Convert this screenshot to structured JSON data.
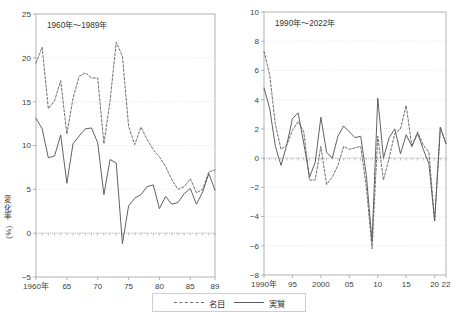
{
  "figure": {
    "top_title": "",
    "background": "#ffffff",
    "series_colors": {
      "nominal": "#6f6f6f",
      "real": "#5a5a5a"
    },
    "axis_color": "#aaaaaa",
    "grid_color": "#d8d8d8"
  },
  "legend": {
    "items": [
      {
        "label": "名目",
        "style": "dashed"
      },
      {
        "label": "実質",
        "style": "solid"
      }
    ]
  },
  "axis_titles": {
    "left": {
      "chars": [
        "変",
        "化",
        "率"
      ],
      "unit": "（%）"
    },
    "right": {
      "chars": [
        "変",
        "化",
        "率"
      ],
      "unit": "（%）"
    }
  },
  "chart_data": [
    {
      "type": "line",
      "id": "left",
      "title": "",
      "annotation": "1960年〜1989年",
      "xlabel": "",
      "ylabel": "変化率（%）",
      "ylim": [
        -5,
        25
      ],
      "yticks": [
        -5,
        0,
        5,
        10,
        15,
        20,
        25
      ],
      "ytick_labels": [
        "-5",
        "0",
        "5",
        "10",
        "15",
        "20",
        "25"
      ],
      "xlim": [
        1960,
        1989
      ],
      "xticks": [
        1960,
        1965,
        1970,
        1975,
        1980,
        1985,
        1989
      ],
      "xtick_labels": [
        "1960年",
        "65",
        "70",
        "75",
        "80",
        "85",
        "89"
      ],
      "grid": true,
      "legend_position": "below-figure",
      "x": [
        1960,
        1961,
        1962,
        1963,
        1964,
        1965,
        1966,
        1967,
        1968,
        1969,
        1970,
        1971,
        1972,
        1973,
        1974,
        1975,
        1976,
        1977,
        1978,
        1979,
        1980,
        1981,
        1982,
        1983,
        1984,
        1985,
        1986,
        1987,
        1988,
        1989
      ],
      "series": [
        {
          "name": "名目",
          "style": "dashed",
          "values": [
            19.4,
            21.2,
            14.2,
            15.1,
            17.4,
            11.3,
            15.4,
            17.9,
            18.3,
            17.7,
            17.7,
            10.2,
            15.1,
            21.8,
            20.2,
            12.2,
            10.1,
            12.1,
            10.7,
            9.5,
            8.7,
            7.6,
            6.1,
            5.0,
            5.3,
            6.2,
            4.6,
            5.0,
            7.0,
            7.2
          ]
        },
        {
          "name": "実質",
          "style": "solid",
          "values": [
            13.1,
            11.9,
            8.6,
            8.8,
            11.2,
            5.7,
            10.2,
            11.1,
            11.9,
            12.0,
            10.3,
            4.4,
            8.4,
            8.0,
            -1.2,
            3.1,
            4.0,
            4.4,
            5.3,
            5.5,
            2.8,
            4.2,
            3.3,
            3.5,
            4.5,
            5.1,
            3.3,
            4.7,
            6.8,
            4.9
          ]
        }
      ]
    },
    {
      "type": "line",
      "id": "right",
      "title": "",
      "annotation": "1990年〜2022年",
      "xlabel": "",
      "ylabel": "変化率（%）",
      "ylim": [
        -8,
        10
      ],
      "yticks": [
        -8,
        -6,
        -4,
        -2,
        0,
        2,
        4,
        6,
        8,
        10
      ],
      "ytick_labels": [
        "-8",
        "-6",
        "-4",
        "-2",
        "0",
        "2",
        "4",
        "6",
        "8",
        "10"
      ],
      "xlim": [
        1990,
        2022
      ],
      "xticks": [
        1990,
        1995,
        2000,
        2005,
        2010,
        2015,
        2020,
        2022
      ],
      "xtick_labels": [
        "1990年",
        "95",
        "2000",
        "05",
        "10",
        "15",
        "20",
        "22"
      ],
      "grid": true,
      "legend_position": "below-figure",
      "x": [
        1990,
        1991,
        1992,
        1993,
        1994,
        1995,
        1996,
        1997,
        1998,
        1999,
        2000,
        2001,
        2002,
        2003,
        2004,
        2005,
        2006,
        2007,
        2008,
        2009,
        2010,
        2011,
        2012,
        2013,
        2014,
        2015,
        2016,
        2017,
        2018,
        2019,
        2020,
        2021,
        2022
      ],
      "series": [
        {
          "name": "名目",
          "style": "dashed",
          "values": [
            7.3,
            5.7,
            2.3,
            0.6,
            0.9,
            1.9,
            2.5,
            1.8,
            -1.5,
            -1.5,
            0.8,
            -1.8,
            -1.3,
            -0.5,
            0.8,
            0.6,
            0.7,
            0.8,
            -2.0,
            -6.2,
            1.5,
            -1.5,
            0.0,
            1.7,
            2.0,
            3.6,
            0.8,
            1.8,
            0.9,
            0.4,
            -4.3,
            2.1,
            1.0
          ]
        },
        {
          "name": "実質",
          "style": "solid",
          "values": [
            4.8,
            3.4,
            0.8,
            -0.5,
            0.9,
            2.7,
            3.1,
            1.0,
            -1.3,
            -0.3,
            2.8,
            0.4,
            0.0,
            1.5,
            2.2,
            1.8,
            1.4,
            1.5,
            -1.2,
            -5.7,
            4.1,
            0.0,
            1.4,
            2.0,
            0.3,
            1.6,
            0.8,
            1.7,
            0.6,
            -0.4,
            -4.3,
            2.1,
            1.0
          ]
        }
      ]
    }
  ]
}
